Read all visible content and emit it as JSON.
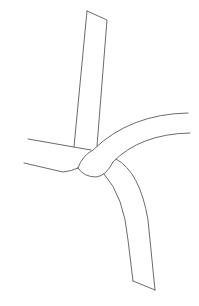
{
  "figure": {
    "stroke_color": "#5a5a5a",
    "background": "#ffffff"
  }
}
